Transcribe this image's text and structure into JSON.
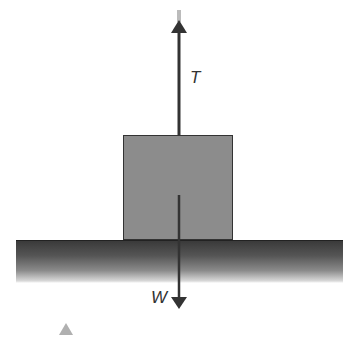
{
  "diagram": {
    "forces": [
      {
        "id": "tension",
        "label": "T",
        "direction": "up"
      },
      {
        "id": "weight",
        "label": "W",
        "direction": "down"
      }
    ],
    "colors": {
      "block": "#8c8c8c",
      "ground": "#444444",
      "arrow": "#333333"
    }
  }
}
